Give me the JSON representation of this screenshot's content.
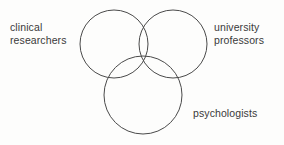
{
  "diagram": {
    "type": "venn-3-circle",
    "background_color": "#fdfdfc",
    "stroke_color": "#4a4a4a",
    "text_color": "#3a3a3a",
    "sets": [
      {
        "id": "clinical-researchers",
        "label_lines": [
          "clinical",
          "researchers"
        ],
        "label_position": "left",
        "circle": {
          "cx": 114,
          "cy": 44,
          "r": 34
        }
      },
      {
        "id": "university-professors",
        "label_lines": [
          "university",
          "professors"
        ],
        "label_position": "right",
        "circle": {
          "cx": 173,
          "cy": 44,
          "r": 34
        }
      },
      {
        "id": "psychologists",
        "label_lines": [
          "psychologists"
        ],
        "label_position": "bottom-right",
        "circle": {
          "cx": 143,
          "cy": 95,
          "r": 39
        }
      }
    ],
    "labels": {
      "clinical_researchers_line1": "clinical",
      "clinical_researchers_line2": "researchers",
      "university_professors_line1": "university",
      "university_professors_line2": "professors",
      "psychologists_line1": "psychologists"
    }
  }
}
